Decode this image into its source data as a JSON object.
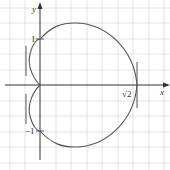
{
  "diagram": {
    "type": "polar-curve-plot",
    "axes": {
      "x_label": "x",
      "y_label": "y",
      "x_tick_label": "√2",
      "y_tick_labels": [
        "1",
        "−1"
      ]
    },
    "colors": {
      "grid": "#d9d9d9",
      "axis": "#333333",
      "curve": "#555555",
      "tangent": "#555555"
    },
    "tangent_lines": [
      "vertical at x=√2",
      "vertical near (-0.2, 0.5)",
      "vertical near (-0.2, -0.5)"
    ]
  }
}
